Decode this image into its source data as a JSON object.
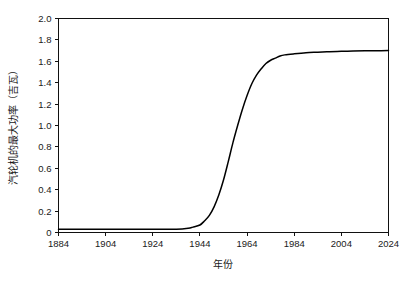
{
  "chart_data": {
    "type": "line",
    "title": "",
    "xlabel": "年份",
    "ylabel": "汽轮机的最大功率（吉瓦）",
    "xlim": [
      1884,
      2024
    ],
    "ylim": [
      0,
      2.0
    ],
    "grid": false,
    "legend": "none",
    "line_color": "#000000",
    "xticks": [
      1884,
      1904,
      1924,
      1944,
      1964,
      1984,
      2004,
      2024
    ],
    "xtick_labels": [
      "1884",
      "1904",
      "1924",
      "1944",
      "1964",
      "1984",
      "2004",
      "2024"
    ],
    "yticks": [
      0,
      0.2,
      0.4,
      0.6,
      0.8,
      1.0,
      1.2,
      1.4,
      1.6,
      1.8,
      2.0
    ],
    "ytick_labels": [
      "0",
      "0.2",
      "0.4",
      "0.6",
      "0.8",
      "1.0",
      "1.2",
      "1.4",
      "1.6",
      "1.8",
      "2.0"
    ],
    "series": [
      {
        "name": "汽轮机的最大功率",
        "x": [
          1884,
          1889,
          1894,
          1899,
          1904,
          1909,
          1914,
          1919,
          1924,
          1929,
          1934,
          1939,
          1941,
          1944,
          1946,
          1948,
          1950,
          1952,
          1954,
          1956,
          1958,
          1960,
          1962,
          1964,
          1966,
          1968,
          1970,
          1972,
          1974,
          1976,
          1978,
          1980,
          1984,
          1989,
          1994,
          1999,
          2004,
          2009,
          2014,
          2019,
          2024
        ],
        "y": [
          0.03,
          0.03,
          0.03,
          0.03,
          0.03,
          0.03,
          0.03,
          0.03,
          0.03,
          0.03,
          0.03,
          0.04,
          0.05,
          0.07,
          0.11,
          0.16,
          0.24,
          0.35,
          0.49,
          0.66,
          0.84,
          1.0,
          1.15,
          1.28,
          1.39,
          1.47,
          1.53,
          1.58,
          1.61,
          1.63,
          1.65,
          1.66,
          1.67,
          1.68,
          1.685,
          1.69,
          1.693,
          1.696,
          1.698,
          1.699,
          1.7
        ]
      }
    ]
  },
  "axis": {
    "y_title": "汽轮机的最大功率（吉瓦）",
    "x_title": "年份"
  }
}
